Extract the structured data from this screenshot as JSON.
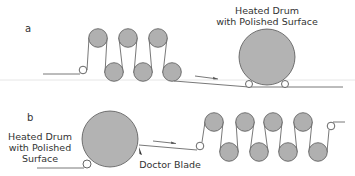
{
  "panels": [
    {
      "id": "a",
      "label": "a",
      "drum_label_line1": "Heated Drum",
      "drum_label_line2": "with Polished Surface"
    },
    {
      "id": "b",
      "label": "b",
      "drum_label_line1": "Heated Drum",
      "drum_label_line2": "with Polished",
      "drum_label_line3": "Surface",
      "blade_label": "Doctor Blade"
    }
  ],
  "colors": {
    "roller_fill": "#b0b0b0",
    "drum_fill": "#b3b3b3",
    "line": "#555555",
    "text": "#333333"
  },
  "icons": {
    "direction_arrow": "arrow-right",
    "doctor_blade": "blade-wedge"
  }
}
